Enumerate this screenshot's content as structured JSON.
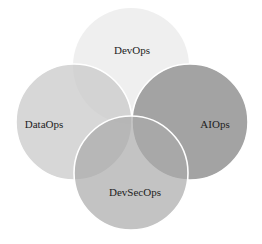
{
  "diagram": {
    "type": "venn",
    "background": "#ffffff",
    "circles": [
      {
        "id": "devops",
        "label": "DevOps",
        "cx": 131,
        "cy": 66,
        "r": 58,
        "fill": "#efefef",
        "opacity": 1,
        "stroke": "none",
        "label_x": 132,
        "label_y": 50
      },
      {
        "id": "dataops",
        "label": "DataOps",
        "cx": 74,
        "cy": 122,
        "r": 58,
        "fill": "#c9c9c9",
        "opacity": 0.75,
        "stroke": "#ffffff",
        "label_x": 44,
        "label_y": 124
      },
      {
        "id": "aiops",
        "label": "AIOps",
        "cx": 190,
        "cy": 122,
        "r": 58,
        "fill": "#a3a3a3",
        "opacity": 1,
        "stroke": "#ffffff",
        "label_x": 215,
        "label_y": 124
      },
      {
        "id": "devsecops",
        "label": "DevSecOps",
        "cx": 131,
        "cy": 173,
        "r": 57,
        "fill": "#a9a9a9",
        "opacity": 0.7,
        "stroke": "#ffffff",
        "label_x": 135,
        "label_y": 192
      }
    ]
  }
}
